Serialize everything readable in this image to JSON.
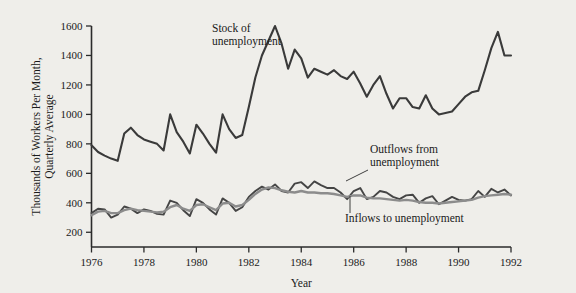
{
  "figure": {
    "background_color": "#efeeea",
    "axis_color": "#2b2b2b"
  },
  "annotations": {
    "stock_label_line1": "Stock of",
    "stock_label_line2": "unemployment",
    "outflows_label_line1": "Outflows from",
    "outflows_label_line2": "unemployment",
    "inflows_label": "Inflows to unemployment"
  },
  "chart_data": {
    "type": "line",
    "title": "",
    "xlabel": "Year",
    "ylabel_line1": "Thousands of Workers Per Month,",
    "ylabel_line2": "Quarterly Average",
    "xlim": [
      1976.0,
      1992.0
    ],
    "ylim": [
      100,
      1600
    ],
    "xticks": [
      1976,
      1978,
      1980,
      1982,
      1984,
      1986,
      1988,
      1990,
      1992
    ],
    "xtick_labels": [
      "1976",
      "1978",
      "1980",
      "1982",
      "1984",
      "1986",
      "1988",
      "1990",
      "1992"
    ],
    "yticks": [
      200,
      400,
      600,
      800,
      1000,
      1200,
      1400,
      1600
    ],
    "ytick_labels": [
      "200",
      "400",
      "600",
      "800",
      "1000",
      "1200",
      "1400",
      "1600"
    ],
    "grid": false,
    "legend_position": "inline-annotations",
    "series": [
      {
        "name": "Stock of unemployment",
        "color": "#3a3a3a",
        "width": 2.1,
        "x": [
          1976.0,
          1976.25,
          1976.5,
          1976.75,
          1977.0,
          1977.25,
          1977.5,
          1977.75,
          1978.0,
          1978.25,
          1978.5,
          1978.75,
          1979.0,
          1979.25,
          1979.5,
          1979.75,
          1980.0,
          1980.25,
          1980.5,
          1980.75,
          1981.0,
          1981.25,
          1981.5,
          1981.75,
          1982.0,
          1982.25,
          1982.5,
          1982.75,
          1983.0,
          1983.25,
          1983.5,
          1983.75,
          1984.0,
          1984.25,
          1984.5,
          1984.75,
          1985.0,
          1985.25,
          1985.5,
          1985.75,
          1986.0,
          1986.25,
          1986.5,
          1986.75,
          1987.0,
          1987.25,
          1987.5,
          1987.75,
          1988.0,
          1988.25,
          1988.5,
          1988.75,
          1989.0,
          1989.25,
          1989.5,
          1989.75,
          1990.0,
          1990.25,
          1990.5,
          1990.75,
          1991.0,
          1991.25,
          1991.5,
          1991.75,
          1992.0
        ],
        "values": [
          790,
          745,
          720,
          700,
          685,
          870,
          910,
          860,
          830,
          815,
          800,
          755,
          1000,
          880,
          815,
          735,
          930,
          870,
          800,
          740,
          1000,
          900,
          840,
          860,
          1050,
          1250,
          1400,
          1500,
          1600,
          1480,
          1310,
          1440,
          1380,
          1250,
          1310,
          1290,
          1270,
          1300,
          1260,
          1240,
          1290,
          1210,
          1120,
          1200,
          1260,
          1140,
          1040,
          1110,
          1110,
          1050,
          1040,
          1130,
          1040,
          1000,
          1010,
          1020,
          1070,
          1120,
          1150,
          1160,
          1300,
          1450,
          1560,
          1400,
          1400
        ]
      },
      {
        "name": "Outflows from unemployment",
        "color": "#454545",
        "width": 1.9,
        "x": [
          1976.0,
          1976.25,
          1976.5,
          1976.75,
          1977.0,
          1977.25,
          1977.5,
          1977.75,
          1978.0,
          1978.25,
          1978.5,
          1978.75,
          1979.0,
          1979.25,
          1979.5,
          1979.75,
          1980.0,
          1980.25,
          1980.5,
          1980.75,
          1981.0,
          1981.25,
          1981.5,
          1981.75,
          1982.0,
          1982.25,
          1982.5,
          1982.75,
          1983.0,
          1983.25,
          1983.5,
          1983.75,
          1984.0,
          1984.25,
          1984.5,
          1984.75,
          1985.0,
          1985.25,
          1985.5,
          1985.75,
          1986.0,
          1986.25,
          1986.5,
          1986.75,
          1987.0,
          1987.25,
          1987.5,
          1987.75,
          1988.0,
          1988.25,
          1988.5,
          1988.75,
          1989.0,
          1989.25,
          1989.5,
          1989.75,
          1990.0,
          1990.25,
          1990.5,
          1990.75,
          1991.0,
          1991.25,
          1991.5,
          1991.75,
          1992.0
        ],
        "values": [
          330,
          360,
          355,
          300,
          320,
          375,
          360,
          330,
          355,
          345,
          325,
          320,
          415,
          400,
          350,
          310,
          425,
          400,
          355,
          320,
          430,
          400,
          345,
          370,
          440,
          480,
          510,
          490,
          525,
          480,
          470,
          530,
          540,
          500,
          545,
          520,
          500,
          500,
          470,
          425,
          480,
          500,
          425,
          440,
          480,
          470,
          440,
          425,
          450,
          455,
          400,
          430,
          445,
          390,
          415,
          440,
          420,
          415,
          425,
          480,
          440,
          495,
          470,
          490,
          450
        ]
      },
      {
        "name": "Inflows to unemployment",
        "color": "#8c8c8c",
        "width": 2.4,
        "x": [
          1976.0,
          1976.25,
          1976.5,
          1976.75,
          1977.0,
          1977.25,
          1977.5,
          1977.75,
          1978.0,
          1978.25,
          1978.5,
          1978.75,
          1979.0,
          1979.25,
          1979.5,
          1979.75,
          1980.0,
          1980.25,
          1980.5,
          1980.75,
          1981.0,
          1981.25,
          1981.5,
          1981.75,
          1982.0,
          1982.25,
          1982.5,
          1982.75,
          1983.0,
          1983.25,
          1983.5,
          1983.75,
          1984.0,
          1984.25,
          1984.5,
          1984.75,
          1985.0,
          1985.25,
          1985.5,
          1985.75,
          1986.0,
          1986.25,
          1986.5,
          1986.75,
          1987.0,
          1987.25,
          1987.5,
          1987.75,
          1988.0,
          1988.25,
          1988.5,
          1988.75,
          1989.0,
          1989.25,
          1989.5,
          1989.75,
          1990.0,
          1990.25,
          1990.5,
          1990.75,
          1991.0,
          1991.25,
          1991.5,
          1991.75,
          1992.0
        ],
        "values": [
          315,
          340,
          345,
          330,
          330,
          350,
          360,
          350,
          345,
          340,
          335,
          340,
          370,
          385,
          360,
          345,
          385,
          390,
          370,
          350,
          395,
          400,
          375,
          385,
          420,
          460,
          490,
          505,
          500,
          485,
          475,
          470,
          480,
          470,
          470,
          465,
          465,
          460,
          450,
          440,
          450,
          450,
          435,
          430,
          430,
          425,
          420,
          415,
          420,
          415,
          405,
          400,
          400,
          395,
          400,
          405,
          410,
          415,
          420,
          435,
          445,
          450,
          455,
          460,
          455
        ]
      }
    ]
  }
}
